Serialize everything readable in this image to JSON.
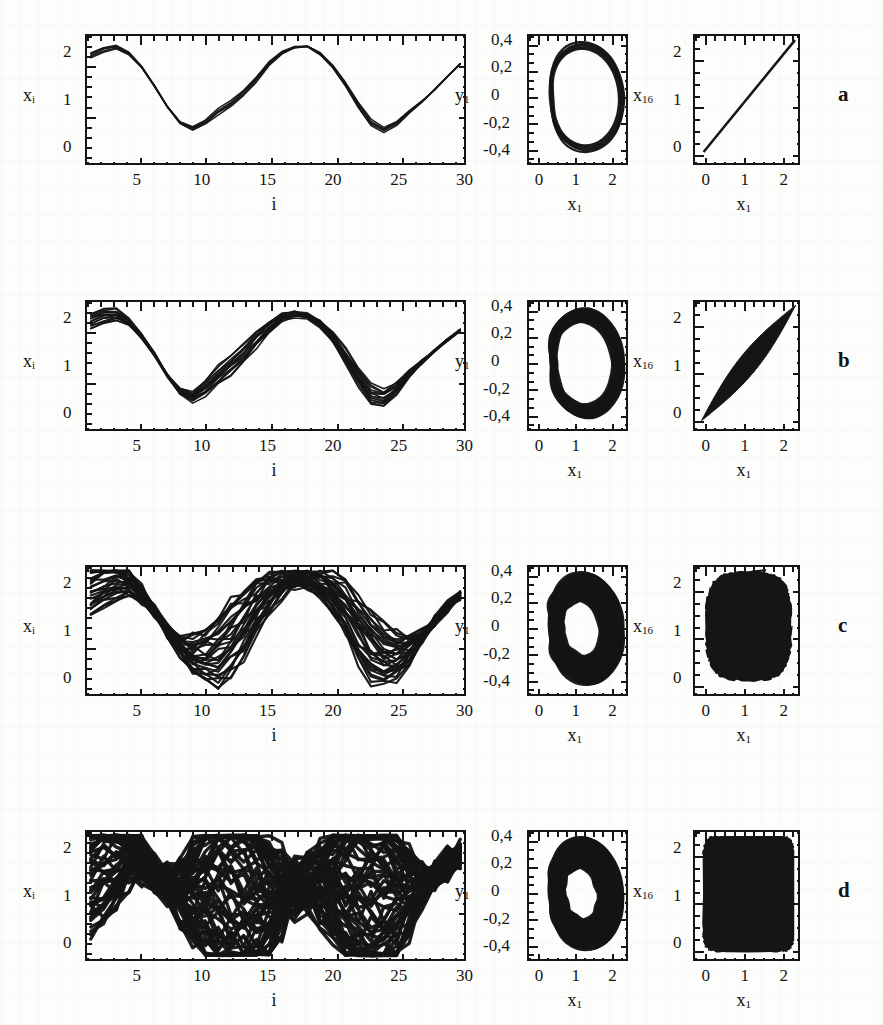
{
  "figure": {
    "caption_label_a": "a",
    "caption_label_b": "b",
    "caption_label_c": "c",
    "caption_label_d": "d",
    "ink_color": "#151515",
    "paper_color": "#fdfdfb"
  },
  "axis_text": {
    "ts_ylabel": "x",
    "ts_ylabel_sub": "i",
    "ts_xlabel": "i",
    "ts_yticks": [
      "0",
      "1",
      "2"
    ],
    "ts_xticks": [
      "5",
      "10",
      "15",
      "20",
      "25",
      "30"
    ],
    "phase_ylabel": "y",
    "phase_ylabel_sub": "1",
    "phase_xlabel": "x",
    "phase_xlabel_sub": "1",
    "phase_yticks": [
      "-0,4",
      "-0,2",
      "0",
      "0,2",
      "0,4"
    ],
    "phase_xticks": [
      "0",
      "1",
      "2"
    ],
    "sync_ylabel": "x",
    "sync_ylabel_sub": "16",
    "sync_xlabel": "x",
    "sync_xlabel_sub": "1",
    "sync_yticks": [
      "0",
      "1",
      "2"
    ],
    "sync_xticks": [
      "0",
      "1",
      "2"
    ]
  },
  "chart_data": {
    "type": "line",
    "title": "",
    "rows": [
      {
        "label": "a",
        "state": "fully synchronized",
        "timeseries": {
          "type": "line",
          "xlabel": "i",
          "ylabel": "x_i",
          "xlim": [
            1,
            30
          ],
          "ylim": [
            -0.35,
            2.4
          ],
          "xticks": [
            5,
            10,
            15,
            20,
            25,
            30
          ],
          "yticks": [
            0,
            1,
            2
          ],
          "band_width": 0.08,
          "n_curves": 5,
          "x": [
            1,
            2,
            3,
            4,
            5,
            6,
            7,
            8,
            9,
            10,
            11,
            12,
            13,
            14,
            15,
            16,
            17,
            18,
            19,
            20,
            21,
            22,
            23,
            24,
            25,
            26,
            27,
            28,
            29,
            30
          ],
          "values": [
            2.0,
            2.12,
            2.17,
            2.02,
            1.72,
            1.32,
            0.88,
            0.52,
            0.4,
            0.55,
            0.78,
            0.95,
            1.18,
            1.48,
            1.8,
            2.04,
            2.16,
            2.17,
            2.02,
            1.74,
            1.36,
            0.92,
            0.54,
            0.38,
            0.52,
            0.76,
            0.98,
            1.24,
            1.52,
            1.8
          ]
        },
        "phase": {
          "type": "line",
          "xlabel": "x_1",
          "ylabel": "y_1",
          "xlim": [
            -0.35,
            2.4
          ],
          "ylim": [
            -0.5,
            0.45
          ],
          "xticks": [
            0,
            1,
            2
          ],
          "yticks": [
            -0.4,
            -0.2,
            0,
            0.2,
            0.4
          ],
          "shape": "thin-loop",
          "fill": 0.1
        },
        "sync": {
          "type": "scatter",
          "xlabel": "x_1",
          "ylabel": "x_16",
          "xlim": [
            -0.35,
            2.4
          ],
          "ylim": [
            -0.35,
            2.4
          ],
          "xticks": [
            0,
            1,
            2
          ],
          "yticks": [
            0,
            1,
            2
          ],
          "shape": "diagonal-line",
          "spread": 0.03
        }
      },
      {
        "label": "b",
        "state": "weakly desynchronized",
        "timeseries": {
          "type": "line",
          "xlabel": "i",
          "ylabel": "x_i",
          "xlim": [
            1,
            30
          ],
          "ylim": [
            -0.35,
            2.4
          ],
          "xticks": [
            5,
            10,
            15,
            20,
            25,
            30
          ],
          "yticks": [
            0,
            1,
            2
          ],
          "band_width": 0.22,
          "n_curves": 14,
          "x": [
            1,
            2,
            3,
            4,
            5,
            6,
            7,
            8,
            9,
            10,
            11,
            12,
            13,
            14,
            15,
            16,
            17,
            18,
            19,
            20,
            21,
            22,
            23,
            24,
            25,
            26,
            27,
            28,
            29,
            30
          ],
          "values": [
            2.0,
            2.1,
            2.14,
            1.98,
            1.66,
            1.26,
            0.82,
            0.46,
            0.36,
            0.55,
            0.82,
            1.05,
            1.3,
            1.6,
            1.88,
            2.06,
            2.14,
            2.1,
            1.94,
            1.64,
            1.24,
            0.8,
            0.42,
            0.34,
            0.54,
            0.84,
            1.1,
            1.34,
            1.58,
            1.78
          ]
        },
        "phase": {
          "type": "line",
          "xlabel": "x_1",
          "ylabel": "y_1",
          "xlim": [
            -0.35,
            2.4
          ],
          "ylim": [
            -0.5,
            0.45
          ],
          "xticks": [
            0,
            1,
            2
          ],
          "yticks": [
            -0.4,
            -0.2,
            0,
            0.2,
            0.4
          ],
          "shape": "thick-loop",
          "fill": 0.35
        },
        "sync": {
          "type": "scatter",
          "xlabel": "x_1",
          "ylabel": "x_16",
          "xlim": [
            -0.35,
            2.4
          ],
          "ylim": [
            -0.35,
            2.4
          ],
          "xticks": [
            0,
            1,
            2
          ],
          "yticks": [
            0,
            1,
            2
          ],
          "shape": "lens",
          "spread": 0.3
        }
      },
      {
        "label": "c",
        "state": "strongly desynchronized",
        "timeseries": {
          "type": "line",
          "xlabel": "i",
          "ylabel": "x_i",
          "xlim": [
            1,
            30
          ],
          "ylim": [
            -0.35,
            2.4
          ],
          "xticks": [
            5,
            10,
            15,
            20,
            25,
            30
          ],
          "yticks": [
            0,
            1,
            2
          ],
          "band_width": 0.8,
          "n_curves": 30,
          "x": [
            1,
            2,
            3,
            4,
            5,
            6,
            7,
            8,
            9,
            10,
            11,
            12,
            13,
            14,
            15,
            16,
            17,
            18,
            19,
            20,
            21,
            22,
            23,
            24,
            25,
            26,
            27,
            28,
            29,
            30
          ],
          "values": [
            1.95,
            2.1,
            2.16,
            2.06,
            1.8,
            1.45,
            1.05,
            0.7,
            0.52,
            0.5,
            0.62,
            0.88,
            1.2,
            1.55,
            1.85,
            2.05,
            2.14,
            2.16,
            2.06,
            1.82,
            1.48,
            1.08,
            0.72,
            0.52,
            0.5,
            0.64,
            0.9,
            1.22,
            1.55,
            1.8
          ]
        },
        "phase": {
          "type": "area",
          "xlabel": "x_1",
          "ylabel": "y_1",
          "xlim": [
            -0.35,
            2.4
          ],
          "ylim": [
            -0.5,
            0.45
          ],
          "xticks": [
            0,
            1,
            2
          ],
          "yticks": [
            -0.4,
            -0.2,
            0,
            0.2,
            0.4
          ],
          "shape": "filled-loop",
          "fill": 0.85
        },
        "sync": {
          "type": "scatter",
          "xlabel": "x_1",
          "ylabel": "x_16",
          "xlim": [
            -0.35,
            2.4
          ],
          "ylim": [
            -0.35,
            2.4
          ],
          "xticks": [
            0,
            1,
            2
          ],
          "yticks": [
            0,
            1,
            2
          ],
          "shape": "blob",
          "spread": 0.8
        }
      },
      {
        "label": "d",
        "state": "fully desynchronized",
        "timeseries": {
          "type": "line",
          "xlabel": "i",
          "ylabel": "x_i",
          "xlim": [
            1,
            30
          ],
          "ylim": [
            -0.35,
            2.4
          ],
          "xticks": [
            5,
            10,
            15,
            20,
            25,
            30
          ],
          "yticks": [
            0,
            1,
            2
          ],
          "band_width": 2.2,
          "n_curves": 60,
          "x": [
            1,
            2,
            3,
            4,
            5,
            6,
            7,
            8,
            9,
            10,
            11,
            12,
            13,
            14,
            15,
            16,
            17,
            18,
            19,
            20,
            21,
            22,
            23,
            24,
            25,
            26,
            27,
            28,
            29,
            30
          ],
          "values": [
            1.9,
            2.05,
            2.1,
            2.05,
            1.8,
            1.5,
            1.25,
            1.1,
            1.15,
            1.25,
            1.3,
            1.28,
            1.2,
            1.05,
            0.95,
            1.05,
            1.2,
            1.3,
            1.32,
            1.3,
            1.25,
            1.2,
            1.15,
            1.1,
            1.05,
            1.1,
            1.25,
            1.45,
            1.7,
            1.9
          ]
        },
        "phase": {
          "type": "area",
          "xlabel": "x_1",
          "ylabel": "y_1",
          "xlim": [
            -0.35,
            2.4
          ],
          "ylim": [
            -0.5,
            0.45
          ],
          "xticks": [
            0,
            1,
            2
          ],
          "yticks": [
            -0.4,
            -0.2,
            0,
            0.2,
            0.4
          ],
          "shape": "filled-loop",
          "fill": 0.92
        },
        "sync": {
          "type": "scatter",
          "xlabel": "x_1",
          "ylabel": "x_16",
          "xlim": [
            -0.35,
            2.4
          ],
          "ylim": [
            -0.35,
            2.4
          ],
          "xticks": [
            0,
            1,
            2
          ],
          "yticks": [
            0,
            1,
            2
          ],
          "shape": "full-square",
          "spread": 1.0
        }
      }
    ]
  }
}
